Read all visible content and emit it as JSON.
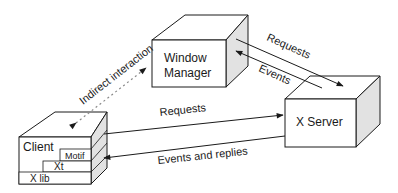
{
  "diagram": {
    "nodes": {
      "window_manager": {
        "line1": "Window",
        "line2": "Manager"
      },
      "x_server": {
        "label": "X Server"
      },
      "client": {
        "label": "Client",
        "layers": {
          "motif": "Motif",
          "xt": "Xt",
          "xlib": "X lib"
        }
      }
    },
    "edges": {
      "indirect": "Indirect interaction",
      "wm_requests": "Requests",
      "wm_events": "Events",
      "client_requests": "Requests",
      "client_events": "Events and replies"
    },
    "colors": {
      "line": "#1a1a1a",
      "side_fill": "#e2e2e2",
      "face_fill": "#ffffff",
      "dashed": "#8a8a8a"
    }
  }
}
